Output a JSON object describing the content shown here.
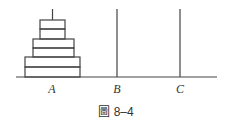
{
  "figure": {
    "caption": "圖 8–4",
    "pegs": [
      {
        "label": "A",
        "x": 52
      },
      {
        "label": "B",
        "x": 117
      },
      {
        "label": "C",
        "x": 180
      }
    ],
    "disks_on_A": 6,
    "colors": {
      "line": "#444444",
      "background": "#ffffff"
    }
  }
}
